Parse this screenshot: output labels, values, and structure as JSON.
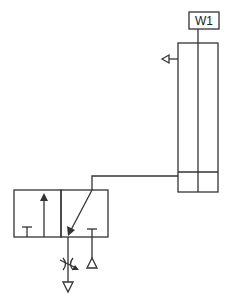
{
  "diagram": {
    "type": "pneumatic-circuit",
    "stroke_color": "#333333",
    "background": "#ffffff",
    "cylinder": {
      "label": "W1",
      "kind": "double-acting cylinder"
    },
    "valve": {
      "kind": "3/2 directional control valve",
      "positions": 2
    },
    "components": [
      "label-box-W1",
      "cylinder",
      "exhaust-arrow",
      "directional-valve",
      "flow-restrictor",
      "exhaust-port",
      "pressure-source"
    ]
  }
}
